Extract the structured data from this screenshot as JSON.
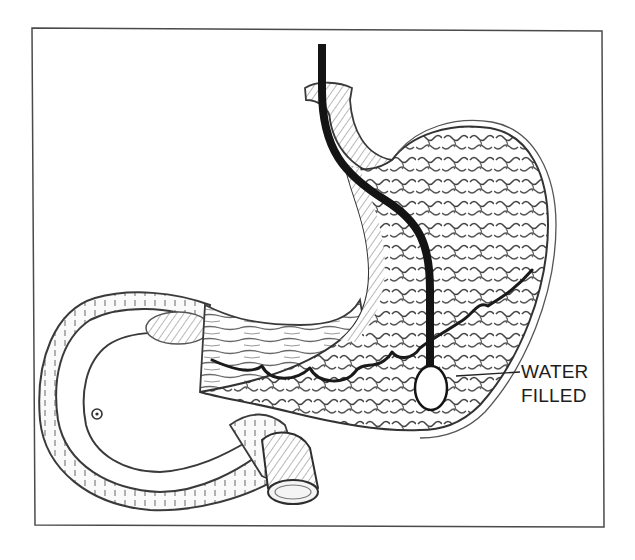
{
  "figure": {
    "callout": {
      "line1": "WATER",
      "line2": "FILLED"
    },
    "colors": {
      "frame": "#4a4a4a",
      "tube": "#141414",
      "outline": "#3a3a3a",
      "shading": "#8c8c8c",
      "light_shading": "#bdbdbd",
      "background": "#ffffff",
      "balloon_fill": "#ffffff"
    },
    "elements": [
      "outer-frame",
      "esophagus",
      "stomach-body",
      "gastric-rugae",
      "catheter-tube",
      "water-filled-balloon",
      "wavy-mucosal-line",
      "pylorus",
      "duodenum-loop",
      "duodenum-cut-end",
      "callout-leader-line"
    ]
  }
}
